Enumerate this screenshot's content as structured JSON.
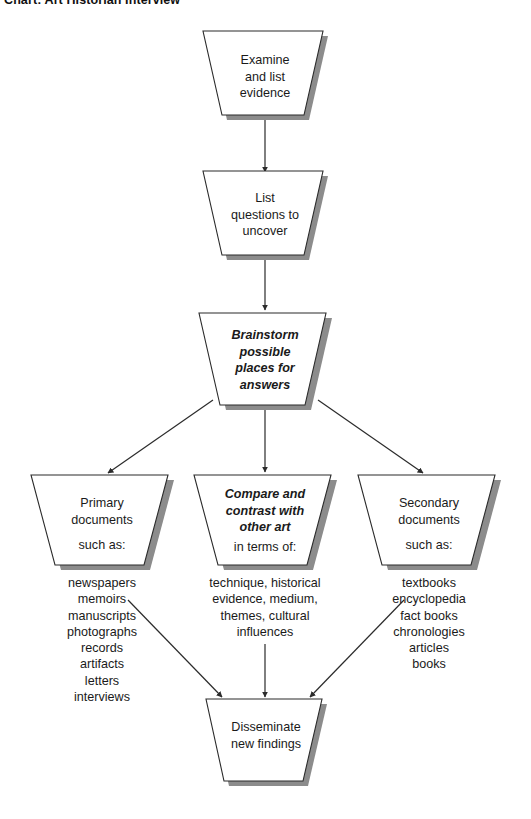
{
  "title": "Chart: Art Historian Interview",
  "diagram": {
    "type": "flowchart",
    "shape": "trapezoid",
    "nodes": {
      "examine": {
        "label": "Examine\nand list\nevidence",
        "emphasis": "normal"
      },
      "list_questions": {
        "label": "List\nquestions to\nuncover",
        "emphasis": "normal"
      },
      "brainstorm": {
        "label": "Brainstorm\npossible\nplaces for\nanswers",
        "emphasis": "bold-italic"
      },
      "primary": {
        "label": "Primary\ndocuments",
        "sublabel": "such as:",
        "emphasis": "normal"
      },
      "compare": {
        "label": "Compare and\ncontrast with\nother art",
        "sublabel": "in terms of:",
        "emphasis": "bold-italic"
      },
      "secondary": {
        "label": "Secondary\ndocuments",
        "sublabel": "such as:",
        "emphasis": "normal"
      },
      "disseminate": {
        "label": "Disseminate\nnew findings",
        "emphasis": "normal"
      }
    },
    "lists": {
      "primary_examples": "newspapers\nmemoirs\nmanuscripts\nphotographs\nrecords\nartifacts\nletters\ninterviews",
      "compare_terms": "technique, historical\nevidence, medium,\nthemes, cultural\ninfluences",
      "secondary_examples": "textbooks\nencyclopedia\nfact books\nchronologies\narticles\nbooks"
    },
    "colors": {
      "stroke": "#2b2b2b",
      "fill": "#ffffff",
      "shadow": "#8c8c8c",
      "text": "#1a1a1a",
      "background": "#ffffff"
    }
  }
}
